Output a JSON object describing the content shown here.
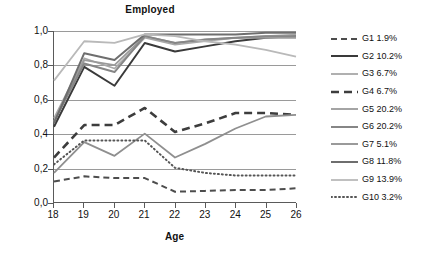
{
  "chart_data": {
    "type": "line",
    "title": "Employed",
    "xlabel": "Age",
    "ylabel": "",
    "x": [
      18,
      19,
      20,
      21,
      22,
      23,
      24,
      25,
      26
    ],
    "xtick_labels": [
      "18",
      "19",
      "20",
      "21",
      "22",
      "23",
      "24",
      "25",
      "26"
    ],
    "ytick_labels": [
      "0,0",
      "0,2",
      "0,4",
      "0,6",
      "0,8",
      "1,0"
    ],
    "ytick_values": [
      0.0,
      0.2,
      0.4,
      0.6,
      0.8,
      1.0
    ],
    "ylim": [
      0.0,
      1.0
    ],
    "xlim": [
      18,
      26
    ],
    "grid": true,
    "legend_position": "right",
    "series": [
      {
        "name": "G1 1.9%",
        "label": "G1 1.9%",
        "percent": "1.9%",
        "style": "dashed",
        "color": "#4d4d4d",
        "width": 2,
        "dash": "6,4",
        "values": [
          0.12,
          0.15,
          0.14,
          0.14,
          0.06,
          0.065,
          0.07,
          0.07,
          0.08
        ]
      },
      {
        "name": "G2 10.2%",
        "label": "G2 10.2%",
        "percent": "10.2%",
        "style": "solid",
        "color": "#3a3a3a",
        "width": 2,
        "dash": "",
        "values": [
          0.44,
          0.79,
          0.68,
          0.93,
          0.88,
          0.91,
          0.94,
          0.96,
          0.97
        ]
      },
      {
        "name": "G3 6.7%",
        "label": "G3 6.7%",
        "percent": "6.7%",
        "style": "solid",
        "color": "#a8a8a8",
        "width": 1.6,
        "dash": "",
        "values": [
          0.49,
          0.84,
          0.78,
          0.96,
          0.92,
          0.94,
          0.96,
          0.97,
          0.98
        ]
      },
      {
        "name": "G4 6.7%",
        "label": "G4 6.7%",
        "percent": "6.7%",
        "style": "dashed",
        "color": "#3d3d3d",
        "width": 2.6,
        "dash": "8,5",
        "values": [
          0.26,
          0.45,
          0.45,
          0.55,
          0.41,
          0.46,
          0.52,
          0.52,
          0.51
        ]
      },
      {
        "name": "G5 20.2%",
        "label": "G5 20.2%",
        "percent": "20.2%",
        "style": "solid",
        "color": "#9a9a9a",
        "width": 1.8,
        "dash": "",
        "values": [
          0.47,
          0.83,
          0.8,
          0.97,
          0.93,
          0.95,
          0.96,
          0.96,
          0.96
        ]
      },
      {
        "name": "G6 20.2%",
        "label": "G6 20.2%",
        "percent": "20.2%",
        "style": "solid",
        "color": "#868686",
        "width": 2,
        "dash": "",
        "values": [
          0.47,
          0.81,
          0.76,
          0.97,
          0.93,
          0.95,
          0.96,
          0.97,
          0.97
        ]
      },
      {
        "name": "G7 5.1%",
        "label": "G7 5.1%",
        "percent": "5.1%",
        "style": "solid",
        "color": "#8f8f8f",
        "width": 1.8,
        "dash": "",
        "values": [
          0.17,
          0.35,
          0.27,
          0.4,
          0.26,
          0.34,
          0.43,
          0.5,
          0.51
        ]
      },
      {
        "name": "G8 11.8%",
        "label": "G8 11.8%",
        "percent": "11.8%",
        "style": "solid",
        "color": "#6e6e6e",
        "width": 2,
        "dash": "",
        "values": [
          0.46,
          0.87,
          0.83,
          0.98,
          0.98,
          0.98,
          0.98,
          0.99,
          0.99
        ]
      },
      {
        "name": "G9 13.9%",
        "label": "G9 13.9%",
        "percent": "13.9%",
        "style": "solid",
        "color": "#b9b9b9",
        "width": 1.8,
        "dash": "",
        "values": [
          0.71,
          0.94,
          0.93,
          0.98,
          0.97,
          0.94,
          0.92,
          0.89,
          0.85
        ]
      },
      {
        "name": "G10 3.2%",
        "label": "G10 3.2%",
        "percent": "3.2%",
        "style": "dotted",
        "color": "#555555",
        "width": 2,
        "dash": "1,3",
        "values": [
          0.22,
          0.36,
          0.36,
          0.36,
          0.2,
          0.17,
          0.155,
          0.155,
          0.155
        ]
      }
    ]
  }
}
